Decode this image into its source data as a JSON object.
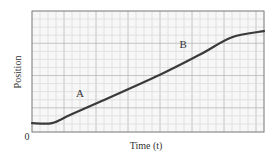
{
  "chart_data": {
    "type": "line",
    "title": "",
    "xlabel": "Time (t)",
    "ylabel": "Position",
    "origin_label": "0",
    "xlim": [
      0,
      29
    ],
    "ylim": [
      0,
      15
    ],
    "grid": true,
    "legend": null,
    "series": [
      {
        "name": "position",
        "x": [
          0,
          2.5,
          4.75,
          8.5,
          16,
          21,
          25,
          29
        ],
        "y": [
          1.1,
          1.1,
          2.1,
          3.75,
          7.1,
          9.6,
          11.75,
          12.5
        ]
      }
    ],
    "annotations": [
      {
        "text": "A",
        "x": 6,
        "y": 4.4
      },
      {
        "text": "B",
        "x": 18.9,
        "y": 10.4
      }
    ]
  },
  "colors": {
    "background": "#ffffff",
    "plot_background": "#f7f7f7",
    "grid_minor": "#dcdcdc",
    "grid_major": "#b8b8b8",
    "frame": "#777777",
    "curve": "#3a3a3a",
    "text": "#333333"
  }
}
